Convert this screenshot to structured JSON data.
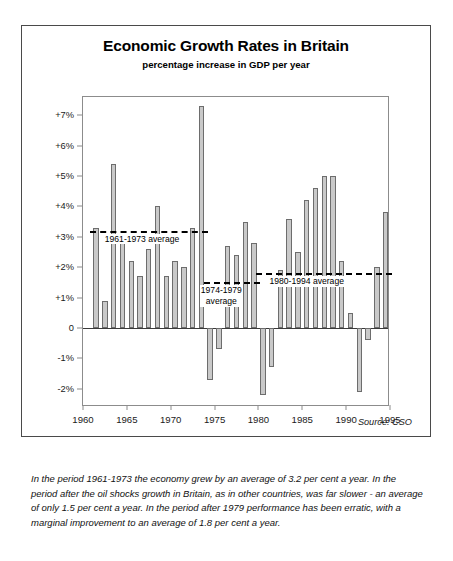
{
  "chart_data": {
    "type": "bar",
    "title": "Economic Growth Rates in Britain",
    "subtitle": "percentage increase in GDP per year",
    "xlabel": "",
    "ylabel": "",
    "ylim": [
      -2.6,
      7.6
    ],
    "xlim": [
      1960,
      1995
    ],
    "grid": false,
    "legend": null,
    "source": "Source: CSO",
    "yticks": [
      {
        "value": 7,
        "label": "+7%"
      },
      {
        "value": 6,
        "label": "+6%"
      },
      {
        "value": 5,
        "label": "+5%"
      },
      {
        "value": 4,
        "label": "+4%"
      },
      {
        "value": 3,
        "label": "+3%"
      },
      {
        "value": 2,
        "label": "+2%"
      },
      {
        "value": 1,
        "label": "+1%"
      },
      {
        "value": 0,
        "label": "0"
      },
      {
        "value": -1,
        "label": "-1%"
      },
      {
        "value": -2,
        "label": "-2%"
      }
    ],
    "xticks": [
      {
        "value": 1960,
        "label": "1960"
      },
      {
        "value": 1965,
        "label": "1965"
      },
      {
        "value": 1970,
        "label": "1970"
      },
      {
        "value": 1975,
        "label": "1975"
      },
      {
        "value": 1980,
        "label": "1980"
      },
      {
        "value": 1985,
        "label": "1985"
      },
      {
        "value": 1990,
        "label": "1990"
      },
      {
        "value": 1995,
        "label": "1995"
      }
    ],
    "categories": [
      1961,
      1962,
      1963,
      1964,
      1965,
      1966,
      1967,
      1968,
      1969,
      1970,
      1971,
      1972,
      1973,
      1974,
      1975,
      1976,
      1977,
      1978,
      1979,
      1980,
      1981,
      1982,
      1983,
      1984,
      1985,
      1986,
      1987,
      1988,
      1989,
      1990,
      1991,
      1992,
      1993,
      1994
    ],
    "values": [
      3.3,
      0.9,
      5.4,
      3.0,
      2.2,
      1.7,
      2.6,
      4.0,
      1.7,
      2.2,
      2.0,
      3.3,
      7.3,
      -1.7,
      -0.7,
      2.7,
      2.4,
      3.5,
      2.8,
      -2.2,
      -1.3,
      1.9,
      3.6,
      2.5,
      4.2,
      4.6,
      5.0,
      5.0,
      2.2,
      0.5,
      -2.1,
      -0.4,
      2.0,
      3.8
    ],
    "annotations": [
      {
        "name": "average-1961-1973",
        "label": "1961-1973 average",
        "value": 3.2,
        "x_start": 1961,
        "x_end": 1973
      },
      {
        "name": "average-1974-1979",
        "label": "1974-1979 average",
        "label_line2": "average",
        "value": 1.5,
        "x_start": 1974,
        "x_end": 1979
      },
      {
        "name": "average-1980-1994",
        "label": "1980-1994 average",
        "value": 1.8,
        "x_start": 1980,
        "x_end": 1994
      }
    ],
    "annotation_labels": {
      "avg1_text": "1961-1973 average",
      "avg2_line1": "1974-1979",
      "avg2_line2": "average",
      "avg3_text": "1980-1994 average"
    },
    "colors": {
      "bar_fill": "#c9c9c9",
      "bar_border": "#6d6d6d",
      "axis": "#8c8c8c",
      "zero_line": "#3a3a3a",
      "average_line": "#000000",
      "frame": "#4a4a4a"
    }
  },
  "caption": {
    "text": "In the period 1961-1973 the economy grew by an average of 3.2 per cent a year. In the period after the oil shocks growth in Britain, as in other countries, was far slower - an average of only 1.5 per cent a year. In the period after 1979 performance has been erratic, with a marginal improvement to an average of 1.8 per cent a year."
  }
}
